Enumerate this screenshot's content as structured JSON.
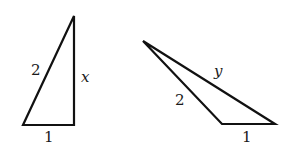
{
  "figure": {
    "stroke_color": "#111111",
    "triangles": [
      {
        "name": "right-triangle",
        "points": [
          [
            74,
            16
          ],
          [
            23,
            125
          ],
          [
            74,
            125
          ]
        ],
        "labels": {
          "hypotenuse": "2",
          "vertical_side": "x",
          "base": "1"
        }
      },
      {
        "name": "obtuse-triangle",
        "points": [
          [
            143,
            41
          ],
          [
            222,
            124
          ],
          [
            275,
            124
          ]
        ],
        "labels": {
          "long_side": "y",
          "left_side": "2",
          "base": "1"
        }
      }
    ]
  }
}
